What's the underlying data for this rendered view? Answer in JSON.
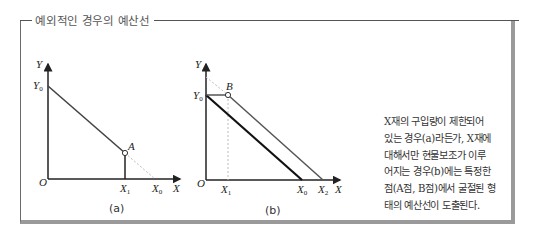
{
  "box": {
    "title": "예외적인 경우의 예산선"
  },
  "graphs": [
    {
      "caption": "(a)",
      "labels": {
        "y_axis": "Y",
        "x_axis": "X",
        "origin": "O",
        "y0": "Y",
        "y0_sub": "0",
        "x1": "X",
        "x1_sub": "1",
        "x0": "X",
        "x0_sub": "0",
        "point": "A"
      }
    },
    {
      "caption": "(b)",
      "labels": {
        "y_axis": "Y",
        "x_axis": "X",
        "origin": "O",
        "y0": "Y",
        "y0_sub": "0",
        "x1": "X",
        "x1_sub": "1",
        "x0": "X",
        "x0_sub": "0",
        "x2": "X",
        "x2_sub": "2",
        "point": "B"
      }
    }
  ],
  "description": {
    "lines": [
      "X재의 구입량이 제한되어",
      "있는 경우(a)라든가, X재에",
      "대해서만 현물보조가 이루",
      "어지는 경우(b)에는 특정한",
      "점(A점, B점)에서 굴절된 형",
      "태의 예산선이 도출된다."
    ]
  },
  "colors": {
    "axis": "#222222",
    "budget_line": "#444444",
    "dotted": "#aaaaaa",
    "frame": "#9a9a9a"
  }
}
